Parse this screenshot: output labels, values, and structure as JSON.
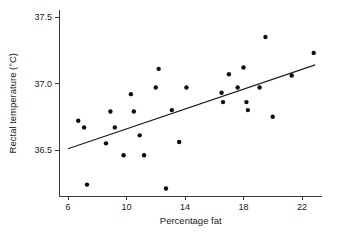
{
  "chart_data": {
    "type": "scatter",
    "title": "",
    "xlabel": "Percentage fat",
    "ylabel": "Rectal temperature (°C)",
    "xlim": [
      5.0,
      23.4
    ],
    "ylim": [
      36.18,
      37.55
    ],
    "xticks": [
      6,
      10,
      14,
      18,
      22
    ],
    "xtick_labels": [
      "6",
      "10",
      "14",
      "18",
      "22"
    ],
    "yticks": [
      36.5,
      37.0,
      37.5
    ],
    "ytick_labels": [
      "36.5",
      "37.0",
      "37.5"
    ],
    "grid": false,
    "legend": "none",
    "marker": "filled-circle",
    "marker_color": "#0d0d0d",
    "line_color": "#1a1a1a",
    "axis_color": "#3a3a3a",
    "points": [
      {
        "x": 6.7,
        "y": 36.72
      },
      {
        "x": 7.1,
        "y": 36.67
      },
      {
        "x": 7.3,
        "y": 36.24
      },
      {
        "x": 8.6,
        "y": 36.55
      },
      {
        "x": 8.9,
        "y": 36.79
      },
      {
        "x": 9.2,
        "y": 36.67
      },
      {
        "x": 9.8,
        "y": 36.46
      },
      {
        "x": 10.3,
        "y": 36.92
      },
      {
        "x": 10.5,
        "y": 36.79
      },
      {
        "x": 10.9,
        "y": 36.61
      },
      {
        "x": 11.2,
        "y": 36.46
      },
      {
        "x": 12.0,
        "y": 36.97
      },
      {
        "x": 12.2,
        "y": 37.11
      },
      {
        "x": 12.7,
        "y": 36.21
      },
      {
        "x": 13.1,
        "y": 36.8
      },
      {
        "x": 13.6,
        "y": 36.56
      },
      {
        "x": 14.1,
        "y": 36.97
      },
      {
        "x": 16.5,
        "y": 36.93
      },
      {
        "x": 16.6,
        "y": 36.86
      },
      {
        "x": 17.0,
        "y": 37.07
      },
      {
        "x": 17.6,
        "y": 36.97
      },
      {
        "x": 18.0,
        "y": 37.12
      },
      {
        "x": 18.2,
        "y": 36.86
      },
      {
        "x": 18.3,
        "y": 36.8
      },
      {
        "x": 19.1,
        "y": 36.97
      },
      {
        "x": 19.5,
        "y": 37.35
      },
      {
        "x": 20.0,
        "y": 36.75
      },
      {
        "x": 21.3,
        "y": 37.06
      },
      {
        "x": 22.8,
        "y": 37.23
      }
    ],
    "fit_line": {
      "label": "least-squares regression line",
      "x_start": 6.0,
      "y_start": 36.51,
      "x_end": 22.9,
      "y_end": 37.14
    }
  }
}
